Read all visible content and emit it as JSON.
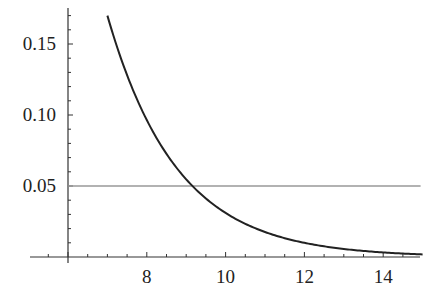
{
  "chart_data": {
    "type": "line",
    "title": "",
    "xlabel": "",
    "ylabel": "",
    "xlim": [
      6,
      15
    ],
    "ylim": [
      0,
      0.17
    ],
    "grid": false,
    "legend": null,
    "x_ticks": [
      "8",
      "10",
      "12",
      "14"
    ],
    "y_ticks": [
      "0.05",
      "0.10",
      "0.15"
    ],
    "series": [
      {
        "name": "decaying curve",
        "color": "#222222",
        "x": [
          7.0,
          7.5,
          8.0,
          8.5,
          9.0,
          9.5,
          10.0,
          10.5,
          11.0,
          11.5,
          12.0,
          12.5,
          13.0,
          13.5,
          14.0,
          14.5,
          15.0
        ],
        "values": [
          0.17,
          0.128,
          0.097,
          0.073,
          0.055,
          0.042,
          0.031,
          0.024,
          0.018,
          0.0135,
          0.01,
          0.0077,
          0.0058,
          0.0044,
          0.0033,
          0.0025,
          0.0019
        ]
      },
      {
        "name": "threshold",
        "color": "#999999",
        "x": [
          6,
          15
        ],
        "values": [
          0.05,
          0.05
        ]
      }
    ],
    "annotations": [
      "horizontal reference line at y = 0.05 crossing curve near x ≈ 9.2"
    ]
  }
}
